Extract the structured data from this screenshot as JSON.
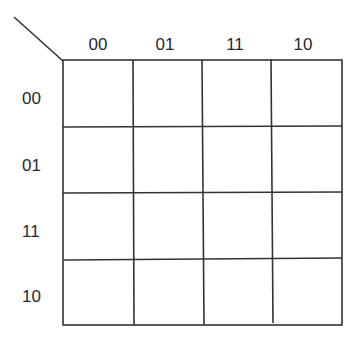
{
  "kmap": {
    "column_labels": [
      "00",
      "01",
      "11",
      "10"
    ],
    "row_labels": [
      "00",
      "01",
      "11",
      "10"
    ],
    "cells": [
      [
        "",
        "",
        "",
        ""
      ],
      [
        "",
        "",
        "",
        ""
      ],
      [
        "",
        "",
        "",
        ""
      ],
      [
        "",
        "",
        "",
        ""
      ]
    ],
    "line_color": "#333333"
  }
}
